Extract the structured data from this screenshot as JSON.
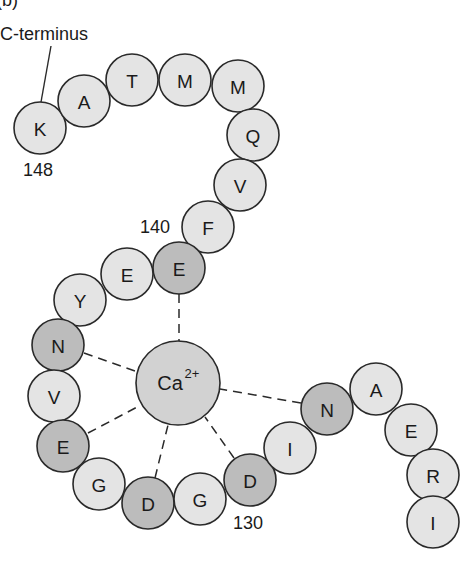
{
  "panel_label": "(b)",
  "labels": {
    "c_terminus": "C-terminus",
    "pos_148": "148",
    "pos_140": "140",
    "pos_130": "130"
  },
  "ion": {
    "symbol": "Ca",
    "charge": "2+",
    "fill": "#d2d2d2"
  },
  "colors": {
    "light": "#e4e4e4",
    "dark": "#bcbcbc",
    "stroke": "#2a2a2a"
  },
  "residues": [
    {
      "letter": "K",
      "x": 40,
      "y": 128,
      "binding": false
    },
    {
      "letter": "A",
      "x": 84,
      "y": 101,
      "binding": false
    },
    {
      "letter": "T",
      "x": 132,
      "y": 80,
      "binding": false
    },
    {
      "letter": "M",
      "x": 185,
      "y": 80,
      "binding": false
    },
    {
      "letter": "M",
      "x": 238,
      "y": 86,
      "binding": false
    },
    {
      "letter": "Q",
      "x": 253,
      "y": 135,
      "binding": false
    },
    {
      "letter": "V",
      "x": 240,
      "y": 185,
      "binding": false
    },
    {
      "letter": "F",
      "x": 208,
      "y": 227,
      "binding": false
    },
    {
      "letter": "E",
      "x": 179,
      "y": 268,
      "binding": true
    },
    {
      "letter": "E",
      "x": 127,
      "y": 274,
      "binding": false
    },
    {
      "letter": "Y",
      "x": 80,
      "y": 300,
      "binding": false
    },
    {
      "letter": "N",
      "x": 58,
      "y": 345,
      "binding": true
    },
    {
      "letter": "V",
      "x": 54,
      "y": 396,
      "binding": false
    },
    {
      "letter": "E",
      "x": 63,
      "y": 446,
      "binding": true
    },
    {
      "letter": "G",
      "x": 99,
      "y": 484,
      "binding": false
    },
    {
      "letter": "D",
      "x": 148,
      "y": 503,
      "binding": true
    },
    {
      "letter": "G",
      "x": 200,
      "y": 499,
      "binding": false
    },
    {
      "letter": "D",
      "x": 250,
      "y": 480,
      "binding": true
    },
    {
      "letter": "I",
      "x": 290,
      "y": 448,
      "binding": false
    },
    {
      "letter": "N",
      "x": 327,
      "y": 409,
      "binding": true
    },
    {
      "letter": "A",
      "x": 376,
      "y": 389,
      "binding": false
    },
    {
      "letter": "E",
      "x": 411,
      "y": 430,
      "binding": false
    },
    {
      "letter": "R",
      "x": 433,
      "y": 475,
      "binding": false
    },
    {
      "letter": "I",
      "x": 433,
      "y": 522,
      "binding": false
    }
  ]
}
